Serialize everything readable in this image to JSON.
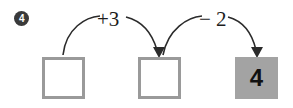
{
  "item": {
    "number": "4",
    "marker_icon": "circled-number-icon"
  },
  "operations": [
    {
      "label": "+3",
      "name": "add-three",
      "value": 3,
      "sign": "+"
    },
    {
      "label": "− 2",
      "name": "subtract-two",
      "value": 2,
      "sign": "−"
    }
  ],
  "boxes": [
    {
      "name": "start-box",
      "value": "",
      "state": "empty",
      "position": "left"
    },
    {
      "name": "middle-box",
      "value": "",
      "state": "empty",
      "position": "middle"
    },
    {
      "name": "result-box",
      "value": "4",
      "state": "filled",
      "position": "right"
    }
  ],
  "colors": {
    "box_border": "#9a9a9a",
    "box_fill_filled": "#a3a3a3",
    "arrow": "#2b2b2b",
    "badge_background": "#3a3a3a",
    "badge_text": "#ffffff",
    "text": "#1d1d1d",
    "page_background": "#ffffff"
  }
}
